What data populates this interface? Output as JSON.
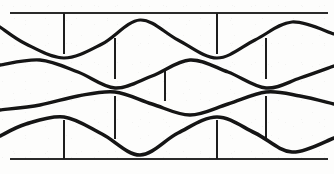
{
  "figure": {
    "width": 334,
    "height": 174,
    "background_color": "#fdfdfc",
    "ink_color": "#151515"
  },
  "chart_data": {
    "type": "line",
    "subtitle": "",
    "xlabel": "",
    "ylabel": "",
    "xlim": [
      0,
      334
    ],
    "ylim": [
      174,
      0
    ],
    "grid": false,
    "legend_position": "none",
    "axis_note": "y axis is in screen pixel coordinates, increasing downward",
    "series": [
      {
        "name": "wave-1",
        "stroke_width": 3.2,
        "wavelength": 152,
        "amplitude": 19,
        "midline_y": 39,
        "phase_note": "trough at x=64 and x=217, crest at x=140 and x=292",
        "points": [
          {
            "x": 0,
            "y": 27
          },
          {
            "x": 26,
            "y": 44
          },
          {
            "x": 64,
            "y": 58
          },
          {
            "x": 102,
            "y": 44
          },
          {
            "x": 140,
            "y": 20
          },
          {
            "x": 178,
            "y": 40
          },
          {
            "x": 217,
            "y": 58
          },
          {
            "x": 255,
            "y": 40
          },
          {
            "x": 292,
            "y": 22
          },
          {
            "x": 334,
            "y": 34
          }
        ]
      },
      {
        "name": "wave-2",
        "stroke_width": 3.4,
        "wavelength": 152,
        "amplitude": 15,
        "midline_y": 74,
        "phase_note": "crest at x=40 and x=190, trough at x=115 and x=266",
        "points": [
          {
            "x": 0,
            "y": 65
          },
          {
            "x": 40,
            "y": 60
          },
          {
            "x": 78,
            "y": 72
          },
          {
            "x": 115,
            "y": 88
          },
          {
            "x": 152,
            "y": 76
          },
          {
            "x": 190,
            "y": 60
          },
          {
            "x": 228,
            "y": 72
          },
          {
            "x": 266,
            "y": 88
          },
          {
            "x": 300,
            "y": 78
          },
          {
            "x": 334,
            "y": 66
          }
        ]
      },
      {
        "name": "wave-3",
        "stroke_width": 3.4,
        "wavelength": 152,
        "amplitude": 12,
        "midline_y": 103,
        "phase_note": "crest at x=115 and x=266, trough at x=190",
        "points": [
          {
            "x": 0,
            "y": 110
          },
          {
            "x": 40,
            "y": 105
          },
          {
            "x": 78,
            "y": 96
          },
          {
            "x": 115,
            "y": 92
          },
          {
            "x": 152,
            "y": 104
          },
          {
            "x": 190,
            "y": 115
          },
          {
            "x": 228,
            "y": 104
          },
          {
            "x": 266,
            "y": 92
          },
          {
            "x": 300,
            "y": 96
          },
          {
            "x": 334,
            "y": 104
          }
        ]
      },
      {
        "name": "wave-4",
        "stroke_width": 3.6,
        "wavelength": 152,
        "amplitude": 19,
        "midline_y": 136,
        "phase_note": "crest at x=64 and x=217, trough at x=140 and x=292",
        "points": [
          {
            "x": 0,
            "y": 136
          },
          {
            "x": 26,
            "y": 124
          },
          {
            "x": 64,
            "y": 117
          },
          {
            "x": 102,
            "y": 134
          },
          {
            "x": 140,
            "y": 155
          },
          {
            "x": 178,
            "y": 133
          },
          {
            "x": 217,
            "y": 117
          },
          {
            "x": 255,
            "y": 133
          },
          {
            "x": 292,
            "y": 152
          },
          {
            "x": 334,
            "y": 138
          }
        ]
      }
    ],
    "boundary_lines": [
      {
        "name": "upper-boundary",
        "y": 13,
        "x_start": 10,
        "x_end": 328,
        "stroke_width": 2.2
      },
      {
        "name": "lower-boundary",
        "y": 159,
        "x_start": 10,
        "x_end": 328,
        "stroke_width": 2.2
      }
    ],
    "tick_marks": [
      {
        "name": "tick-upper-left",
        "x": 64,
        "y_start": 13,
        "y_end": 54,
        "stroke_width": 2.0
      },
      {
        "name": "tick-upper-right",
        "x": 217,
        "y_start": 13,
        "y_end": 54,
        "stroke_width": 2.0
      },
      {
        "name": "tick-mid-upper-left",
        "x": 115,
        "y_start": 38,
        "y_end": 79,
        "stroke_width": 2.0
      },
      {
        "name": "tick-mid-upper-right",
        "x": 266,
        "y_start": 38,
        "y_end": 79,
        "stroke_width": 2.0
      },
      {
        "name": "tick-center-short",
        "x": 165,
        "y_start": 71,
        "y_end": 101,
        "stroke_width": 2.0
      },
      {
        "name": "tick-mid-lower-left",
        "x": 115,
        "y_start": 96,
        "y_end": 139,
        "stroke_width": 2.0
      },
      {
        "name": "tick-mid-lower-right",
        "x": 266,
        "y_start": 96,
        "y_end": 139,
        "stroke_width": 2.0
      },
      {
        "name": "tick-lower-left",
        "x": 64,
        "y_start": 120,
        "y_end": 159,
        "stroke_width": 2.0
      },
      {
        "name": "tick-lower-right",
        "x": 217,
        "y_start": 120,
        "y_end": 159,
        "stroke_width": 2.0
      }
    ]
  }
}
